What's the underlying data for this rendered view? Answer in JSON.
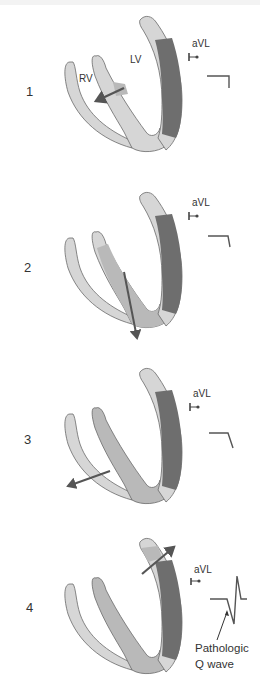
{
  "colors": {
    "wall_light": "#d6d6d6",
    "wall_mid": "#b9b9b9",
    "wall_dark": "#6e6e6e",
    "outline": "#6a6a6a",
    "arrow": "#555555",
    "text": "#333333"
  },
  "panels": [
    {
      "number": "1",
      "labels": {
        "rv": "RV",
        "lv": "LV",
        "lead": "aVL"
      },
      "ecg": "flat-st-elevation"
    },
    {
      "number": "2",
      "labels": {
        "lead": "aVL"
      },
      "ecg": "flat-st-elevation"
    },
    {
      "number": "3",
      "labels": {
        "lead": "aVL"
      },
      "ecg": "flat-st-elevation"
    },
    {
      "number": "4",
      "labels": {
        "lead": "aVL"
      },
      "ecg": "pathologic-q-wave",
      "annotation": {
        "line1": "Pathologic",
        "line2": "Q wave"
      }
    }
  ]
}
